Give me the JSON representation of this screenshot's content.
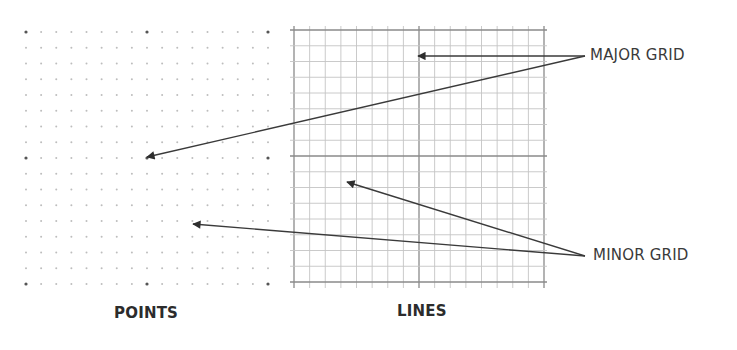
{
  "diagram": {
    "callouts": {
      "major": "MAJOR GRID",
      "minor": "MINOR GRID"
    },
    "captions": {
      "points": "POINTS",
      "lines": "LINES"
    },
    "colors": {
      "minor_dot": "#bdbdbd",
      "major_dot": "#555555",
      "minor_line": "#c4c4c4",
      "major_line": "#8a8a8a",
      "arrow": "#3a3a3a",
      "text": "#3a3a3a"
    },
    "points_grid": {
      "x0": 26,
      "y0": 32,
      "cols": 17,
      "rows": 17,
      "dx": 15.125,
      "dy": 15.75,
      "major_every": 8
    },
    "lines_grid": {
      "x0": 294,
      "y0": 30,
      "cols": 16,
      "rows": 16,
      "dx": 15.625,
      "dy": 15.75,
      "major_every": 8
    },
    "arrows": [
      {
        "group": "major",
        "from": [
          585,
          56
        ],
        "to": [
          418,
          56
        ]
      },
      {
        "group": "major",
        "from": [
          585,
          56
        ],
        "to": [
          147,
          157
        ]
      },
      {
        "group": "minor",
        "from": [
          585,
          256
        ],
        "to": [
          347,
          182
        ]
      },
      {
        "group": "minor",
        "from": [
          585,
          256
        ],
        "to": [
          193,
          224
        ]
      }
    ]
  }
}
